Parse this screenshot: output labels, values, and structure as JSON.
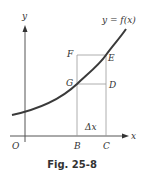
{
  "figure": {
    "caption": "Fig. 25-8",
    "curve_label": "y = f(x)",
    "axes": {
      "x_label": "x",
      "y_label": "y",
      "origin_label": "O"
    },
    "points": {
      "F": "F",
      "E": "E",
      "G": "G",
      "D": "D",
      "B": "B",
      "C": "C"
    },
    "delta_label": "Δx",
    "colors": {
      "curve": "#3a3a3a",
      "lines": "#9a9a9a",
      "axes": "#555555",
      "text": "#333333"
    }
  }
}
